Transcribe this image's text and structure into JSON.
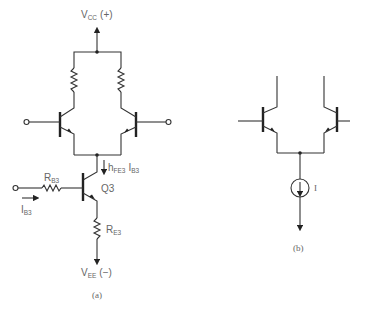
{
  "figure_a": {
    "supply_top": "V",
    "supply_top_sub": "CC",
    "supply_top_sign": "(+)",
    "supply_bottom": "V",
    "supply_bottom_sub": "EE",
    "supply_bottom_sign": "(−)",
    "transistor_label": "Q3",
    "base_resistor": "R",
    "base_resistor_sub": "B3",
    "emitter_resistor": "R",
    "emitter_resistor_sub": "E3",
    "base_current": "I",
    "base_current_sub": "B3",
    "collector_current_h": "h",
    "collector_current_h_sub": "FE3",
    "collector_current_i": "I",
    "collector_current_i_sub": "B3",
    "caption": "(a)"
  },
  "figure_b": {
    "current_source_label": "I",
    "caption": "(b)"
  }
}
